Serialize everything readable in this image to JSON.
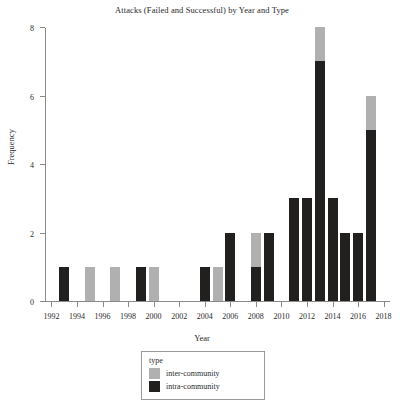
{
  "chart_data": {
    "type": "bar",
    "title": "Attacks (Failed and Successful) by Year and Type",
    "xlabel": "Year",
    "ylabel": "Frequency",
    "stacked": true,
    "grid": false,
    "legend_position": "below-plot-center",
    "legend_title": "type",
    "xlim": [
      1991.5,
      2018.5
    ],
    "ylim": [
      0,
      8
    ],
    "xticks": [
      1992,
      1994,
      1996,
      1998,
      2000,
      2002,
      2004,
      2006,
      2008,
      2010,
      2012,
      2014,
      2016,
      2018
    ],
    "yticks": [
      0,
      2,
      4,
      6,
      8
    ],
    "categories": [
      1993,
      1995,
      1997,
      1999,
      2000,
      2004,
      2005,
      2006,
      2008,
      2009,
      2011,
      2012,
      2013,
      2014,
      2015,
      2016,
      2017
    ],
    "series": [
      {
        "name": "intra-community",
        "color": "#221f1f",
        "values": [
          1,
          0,
          0,
          1,
          0,
          1,
          0,
          2,
          1,
          2,
          3,
          3,
          7,
          3,
          2,
          2,
          5
        ]
      },
      {
        "name": "inter-community",
        "color": "#b0b0b0",
        "values": [
          0,
          1,
          1,
          0,
          1,
          0,
          1,
          0,
          1,
          0,
          0,
          0,
          1,
          0,
          0,
          0,
          1
        ]
      }
    ],
    "totals": [
      1,
      1,
      1,
      1,
      1,
      1,
      1,
      2,
      2,
      2,
      3,
      3,
      8,
      3,
      2,
      2,
      6
    ]
  },
  "legend": {
    "title": "type",
    "entries": [
      {
        "label": "inter-community",
        "color": "#b0b0b0"
      },
      {
        "label": "intra-community",
        "color": "#221f1f"
      }
    ]
  },
  "footer": {
    "text": ""
  }
}
